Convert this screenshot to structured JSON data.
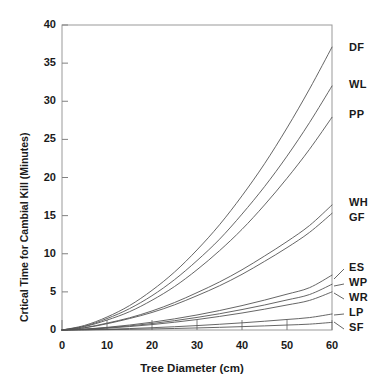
{
  "chart_data": {
    "type": "line",
    "title": "",
    "xlabel": "Tree Diameter (cm)",
    "ylabel": "Crtical Time for Cambial Kill (Minutes)",
    "xlim": [
      0,
      60
    ],
    "ylim": [
      0,
      40
    ],
    "xticks": [
      0,
      10,
      20,
      30,
      40,
      50,
      60
    ],
    "yticks": [
      0,
      5,
      10,
      15,
      20,
      25,
      30,
      35,
      40
    ],
    "grid": false,
    "legend_position": "right-inline-labels",
    "line_color": "#555555",
    "axis_color": "#808080",
    "text_color": "#1a1a1a",
    "x": [
      0,
      5,
      10,
      15,
      20,
      25,
      30,
      35,
      40,
      45,
      50,
      55,
      60
    ],
    "series": [
      {
        "name": "DF",
        "label": "DF",
        "values": [
          0.0,
          0.6,
          1.7,
          3.2,
          5.2,
          7.6,
          10.5,
          13.8,
          17.6,
          21.8,
          26.5,
          31.6,
          37.1
        ]
      },
      {
        "name": "WL",
        "label": "WL",
        "values": [
          0.0,
          0.5,
          1.5,
          2.8,
          4.5,
          6.6,
          9.1,
          11.9,
          15.2,
          18.8,
          22.8,
          27.2,
          32.0
        ]
      },
      {
        "name": "PP",
        "label": "PP",
        "values": [
          0.0,
          0.45,
          1.3,
          2.4,
          3.9,
          5.7,
          7.9,
          10.4,
          13.2,
          16.4,
          19.9,
          23.7,
          27.9
        ]
      },
      {
        "name": "WH",
        "label": "WH",
        "values": [
          0.0,
          0.3,
          0.9,
          1.6,
          2.5,
          3.6,
          4.9,
          6.3,
          7.9,
          9.7,
          11.6,
          13.7,
          16.4
        ]
      },
      {
        "name": "GF",
        "label": "GF",
        "values": [
          0.0,
          0.28,
          0.82,
          1.5,
          2.3,
          3.3,
          4.5,
          5.8,
          7.3,
          9.0,
          10.8,
          12.8,
          15.3
        ]
      },
      {
        "name": "ES",
        "label": "ES",
        "values": [
          0.0,
          0.12,
          0.35,
          0.65,
          1.02,
          1.46,
          1.97,
          2.55,
          3.2,
          3.92,
          4.7,
          5.55,
          7.2
        ]
      },
      {
        "name": "WP",
        "label": "WP",
        "values": [
          0.0,
          0.1,
          0.29,
          0.54,
          0.85,
          1.22,
          1.65,
          2.13,
          2.68,
          3.28,
          3.94,
          4.65,
          6.0
        ]
      },
      {
        "name": "WR",
        "label": "WR",
        "values": [
          0.0,
          0.08,
          0.24,
          0.45,
          0.71,
          1.02,
          1.37,
          1.78,
          2.23,
          2.73,
          3.28,
          3.88,
          5.0
        ]
      },
      {
        "name": "LP",
        "label": "LP",
        "values": [
          0.0,
          0.03,
          0.1,
          0.19,
          0.3,
          0.43,
          0.58,
          0.75,
          0.94,
          1.15,
          1.38,
          1.63,
          2.1
        ]
      },
      {
        "name": "SF",
        "label": "SF",
        "values": [
          0.0,
          0.015,
          0.05,
          0.09,
          0.14,
          0.2,
          0.27,
          0.35,
          0.44,
          0.54,
          0.65,
          0.77,
          1.0
        ]
      }
    ]
  },
  "axes": {
    "x_tick_labels": [
      "0",
      "10",
      "20",
      "30",
      "40",
      "50",
      "60"
    ],
    "y_tick_labels": [
      "0",
      "5",
      "10",
      "15",
      "20",
      "25",
      "30",
      "35",
      "40"
    ],
    "x_axis_title": "Tree Diameter (cm)",
    "y_axis_title": "Crtical Time for Cambial Kill (Minutes)"
  },
  "series_labels": {
    "df": "DF",
    "wl": "WL",
    "pp": "PP",
    "wh": "WH",
    "gf": "GF",
    "es": "ES",
    "wp": "WP",
    "wr": "WR",
    "lp": "LP",
    "sf": "SF"
  }
}
